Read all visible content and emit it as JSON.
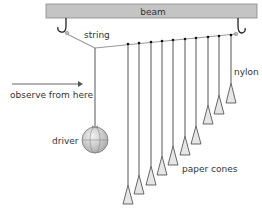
{
  "diagram": {
    "labels": {
      "beam": "beam",
      "string": "string",
      "nylon": "nylon",
      "observe": "observe from here",
      "driver": "driver",
      "cones": "paper cones"
    },
    "colors": {
      "beam_fill": "#c4c4c4",
      "beam_stroke": "#888888",
      "line": "#444444",
      "string": "#9a9a9a",
      "cone_fill": "#e6e6e6",
      "ball_fill": "#d4d4d4",
      "text": "#333333"
    },
    "beam": {
      "x": 46,
      "y": 4,
      "width": 211,
      "height": 14
    },
    "hooks": [
      {
        "x": 66,
        "y": 18
      },
      {
        "x": 238,
        "y": 18
      }
    ],
    "knee": {
      "x": 95,
      "y": 48
    },
    "driver": {
      "x": 95,
      "y": 140,
      "r": 13
    },
    "pendulums": [
      {
        "x": 128,
        "top": 44,
        "cone_top": 185,
        "cone_bottom": 204
      },
      {
        "x": 139,
        "top": 43,
        "cone_top": 175,
        "cone_bottom": 194
      },
      {
        "x": 151,
        "top": 42,
        "cone_top": 166,
        "cone_bottom": 185
      },
      {
        "x": 162,
        "top": 41,
        "cone_top": 156,
        "cone_bottom": 175
      },
      {
        "x": 173,
        "top": 40,
        "cone_top": 146,
        "cone_bottom": 165
      },
      {
        "x": 185,
        "top": 39,
        "cone_top": 136,
        "cone_bottom": 155
      },
      {
        "x": 196,
        "top": 38,
        "cone_top": 126,
        "cone_bottom": 144
      },
      {
        "x": 208,
        "top": 37,
        "cone_top": 105,
        "cone_bottom": 124
      },
      {
        "x": 219,
        "top": 36,
        "cone_top": 95,
        "cone_bottom": 114
      },
      {
        "x": 231,
        "top": 35,
        "cone_top": 83,
        "cone_bottom": 103
      }
    ]
  }
}
